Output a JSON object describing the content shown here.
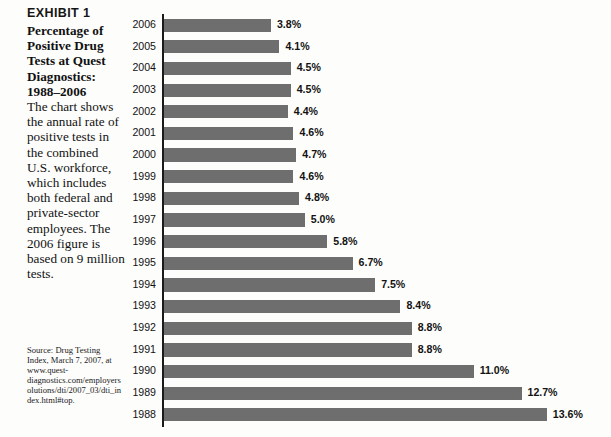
{
  "exhibit": {
    "label": "EXHIBIT 1",
    "heading": "Percentage of Positive Drug Tests at Quest Diagnostics: 1988–2006",
    "body": "The chart shows the annual rate of positive tests in the combined U.S. workforce, which includes both federal and private-sector employees. The 2006 figure is based on 9 million tests.",
    "source": "Source: Drug Testing Index, March 7, 2007, at www.quest-diagnostics.com/employersolutions/dti/2007_03/dti_index.html#top."
  },
  "colors": {
    "bar": "#6e6e6e",
    "axis": "#1b1b1b",
    "text": "#121212",
    "background": "#fdfdfc"
  },
  "chart_data": {
    "type": "bar",
    "orientation": "horizontal",
    "title": "Percentage of Positive Drug Tests at Quest Diagnostics: 1988–2006",
    "xlabel": "",
    "ylabel": "",
    "xlim": [
      0,
      13.6
    ],
    "grid": false,
    "legend": null,
    "value_suffix": "%",
    "categories": [
      "2006",
      "2005",
      "2004",
      "2003",
      "2002",
      "2001",
      "2000",
      "1999",
      "1998",
      "1997",
      "1996",
      "1995",
      "1994",
      "1993",
      "1992",
      "1991",
      "1990",
      "1989",
      "1988"
    ],
    "values": [
      3.8,
      4.1,
      4.5,
      4.5,
      4.4,
      4.6,
      4.7,
      4.6,
      4.8,
      5.0,
      5.8,
      6.7,
      7.5,
      8.4,
      8.8,
      8.8,
      11.0,
      12.7,
      13.6
    ],
    "labels": [
      "3.8%",
      "4.1%",
      "4.5%",
      "4.5%",
      "4.4%",
      "4.6%",
      "4.7%",
      "4.6%",
      "4.8%",
      "5.0%",
      "5.8%",
      "6.7%",
      "7.5%",
      "8.4%",
      "8.8%",
      "8.8%",
      "11.0%",
      "12.7%",
      "13.6%"
    ]
  }
}
